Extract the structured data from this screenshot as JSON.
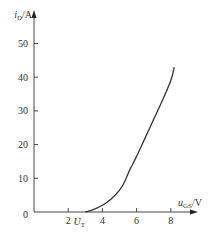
{
  "chart_data": {
    "type": "line",
    "title": "",
    "xlabel": "u_GS/V",
    "ylabel": "i_D/A",
    "xlabel_parts": {
      "main": "u",
      "sub": "GS",
      "unit": "/V"
    },
    "ylabel_parts": {
      "main": "i",
      "sub": "D",
      "unit": "/A"
    },
    "xlim": [
      0,
      9
    ],
    "ylim": [
      0,
      55
    ],
    "x_ticks": [
      2,
      4,
      6,
      8
    ],
    "x_tick_labels": [
      "2",
      "4",
      "6",
      "8"
    ],
    "y_ticks": [
      10,
      20,
      30,
      40,
      50
    ],
    "y_tick_labels": [
      "10",
      "20",
      "30",
      "40",
      "50"
    ],
    "origin_label": "0",
    "grid": false,
    "annotations": [
      {
        "text": "U_T",
        "main": "U",
        "sub": "T",
        "x": 3.0
      }
    ],
    "series": [
      {
        "name": "transfer characteristic",
        "x": [
          3.0,
          3.5,
          4.0,
          4.5,
          5.0,
          5.3,
          5.6,
          6.0,
          6.5,
          7.0,
          7.5,
          8.0,
          8.2
        ],
        "y": [
          0,
          0.8,
          2.0,
          3.8,
          6.5,
          9.0,
          12.5,
          16.5,
          22.0,
          27.5,
          33.0,
          39.0,
          43.0
        ]
      }
    ]
  }
}
